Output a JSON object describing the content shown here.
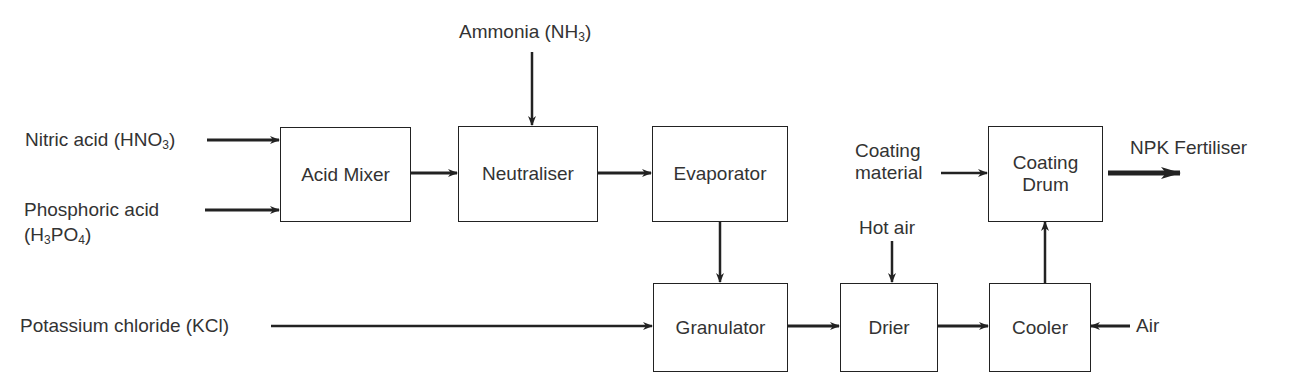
{
  "diagram": {
    "type": "process-flow",
    "title": "",
    "units": [
      {
        "id": "acid_mixer",
        "label": "Acid Mixer"
      },
      {
        "id": "neutraliser",
        "label": "Neutraliser"
      },
      {
        "id": "evaporator",
        "label": "Evaporator"
      },
      {
        "id": "granulator",
        "label": "Granulator"
      },
      {
        "id": "drier",
        "label": "Drier"
      },
      {
        "id": "cooler",
        "label": "Cooler"
      },
      {
        "id": "coating_drum",
        "label_line1": "Coating",
        "label_line2": "Drum"
      }
    ],
    "inputs": {
      "nitric_acid": {
        "text": "Nitric acid (HNO",
        "sub": "3",
        "close": ")"
      },
      "phosphoric_acid": {
        "line1": "Phosphoric acid",
        "line2_open": "(H",
        "sub1": "3",
        "mid": "PO",
        "sub2": "4",
        "close": ")"
      },
      "ammonia": {
        "text": "Ammonia (NH",
        "sub": "3",
        "close": ")"
      },
      "potassium_chloride": {
        "text": "Potassium chloride (KCl)"
      },
      "coating_material": {
        "line1": "Coating",
        "line2": "material"
      },
      "hot_air": {
        "text": "Hot air"
      },
      "air": {
        "text": "Air"
      }
    },
    "outputs": {
      "npk_fertiliser": {
        "text": "NPK Fertiliser"
      }
    },
    "flows": [
      {
        "from": "Nitric acid (HNO3)",
        "to": "Acid Mixer"
      },
      {
        "from": "Phosphoric acid (H3PO4)",
        "to": "Acid Mixer"
      },
      {
        "from": "Acid Mixer",
        "to": "Neutraliser"
      },
      {
        "from": "Ammonia (NH3)",
        "to": "Neutraliser"
      },
      {
        "from": "Neutraliser",
        "to": "Evaporator"
      },
      {
        "from": "Evaporator",
        "to": "Granulator"
      },
      {
        "from": "Potassium chloride (KCl)",
        "to": "Granulator"
      },
      {
        "from": "Granulator",
        "to": "Drier"
      },
      {
        "from": "Hot air",
        "to": "Drier"
      },
      {
        "from": "Drier",
        "to": "Cooler"
      },
      {
        "from": "Air",
        "to": "Cooler"
      },
      {
        "from": "Cooler",
        "to": "Coating Drum"
      },
      {
        "from": "Coating material",
        "to": "Coating Drum"
      },
      {
        "from": "Coating Drum",
        "to": "NPK Fertiliser"
      }
    ],
    "colors": {
      "line": "#222222",
      "text": "#333333",
      "background": "#ffffff"
    }
  }
}
